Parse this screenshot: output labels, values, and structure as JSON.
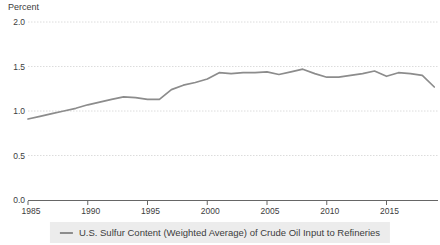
{
  "chart": {
    "y_axis_title": "Percent",
    "legend_label": "U.S. Sulfur Content (Weighted Average) of Crude Oil Input to Refineries",
    "colors": {
      "line": "#8c8c8c",
      "grid": "#dcdcdc",
      "axis": "#666666",
      "tick_text": "#3c3c3c",
      "legend_bg": "#ececec",
      "background": "#ffffff"
    }
  },
  "chart_data": {
    "type": "line",
    "title": "",
    "xlabel": "",
    "ylabel": "Percent",
    "legend_position": "bottom",
    "grid": true,
    "ylim": [
      0.0,
      2.0
    ],
    "yticks": [
      0.0,
      0.5,
      1.0,
      1.5,
      2.0
    ],
    "xticks": [
      1985,
      1990,
      1995,
      2000,
      2005,
      2010,
      2015
    ],
    "x": [
      1985,
      1986,
      1987,
      1988,
      1989,
      1990,
      1991,
      1992,
      1993,
      1994,
      1995,
      1996,
      1997,
      1998,
      1999,
      2000,
      2001,
      2002,
      2003,
      2004,
      2005,
      2006,
      2007,
      2008,
      2009,
      2010,
      2011,
      2012,
      2013,
      2014,
      2015,
      2016,
      2017,
      2018,
      2019
    ],
    "series": [
      {
        "name": "U.S. Sulfur Content (Weighted Average) of Crude Oil Input to Refineries",
        "values": [
          0.91,
          0.94,
          0.97,
          1.0,
          1.03,
          1.07,
          1.1,
          1.13,
          1.16,
          1.15,
          1.13,
          1.13,
          1.24,
          1.29,
          1.32,
          1.36,
          1.43,
          1.42,
          1.43,
          1.43,
          1.44,
          1.41,
          1.44,
          1.47,
          1.42,
          1.38,
          1.38,
          1.4,
          1.42,
          1.45,
          1.39,
          1.43,
          1.42,
          1.4,
          1.27
        ]
      }
    ]
  }
}
